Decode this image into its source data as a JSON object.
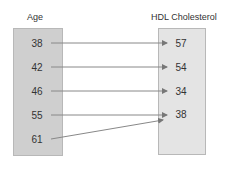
{
  "domain": {
    "title": "Age",
    "values": [
      "38",
      "42",
      "46",
      "55",
      "61"
    ]
  },
  "range": {
    "title": "HDL Cholesterol",
    "values": [
      "57",
      "54",
      "34",
      "38"
    ]
  },
  "mapping": [
    {
      "from": "38",
      "to": "57"
    },
    {
      "from": "42",
      "to": "54"
    },
    {
      "from": "46",
      "to": "34"
    },
    {
      "from": "55",
      "to": "38"
    },
    {
      "from": "61",
      "to": "38"
    }
  ],
  "colors": {
    "left_box": "#cfcfcf",
    "right_box": "#e4e4e4",
    "arrow": "#777777"
  }
}
